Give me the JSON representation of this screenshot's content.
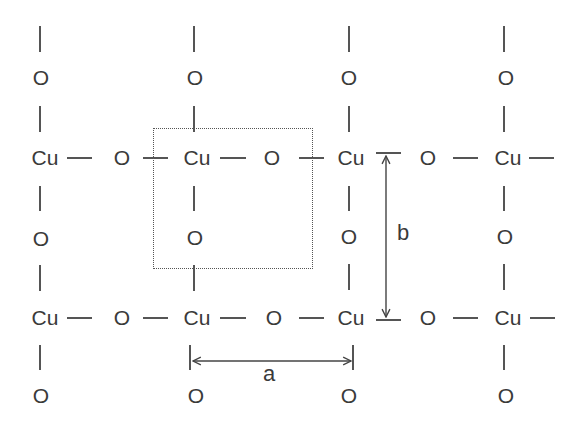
{
  "diagram": {
    "atoms": {
      "copper": "Cu",
      "oxygen": "O"
    },
    "lattice_constants": {
      "a": "a",
      "b": "b"
    },
    "grid": {
      "rows": [
        [
          "O",
          "O",
          "O",
          "O"
        ],
        [
          "Cu",
          "O",
          "Cu",
          "O",
          "Cu",
          "O",
          "Cu"
        ],
        [
          "O",
          "O",
          "O",
          "O"
        ],
        [
          "Cu",
          "O",
          "Cu",
          "O",
          "Cu",
          "O",
          "Cu"
        ],
        [
          "O",
          "O",
          "O",
          "O"
        ]
      ]
    },
    "unit_cell": {
      "style": "dotted",
      "contains": [
        "Cu",
        "O",
        "O"
      ]
    },
    "colors": {
      "line": "#555555",
      "text": "#3a3a3a",
      "background": "#ffffff"
    }
  }
}
